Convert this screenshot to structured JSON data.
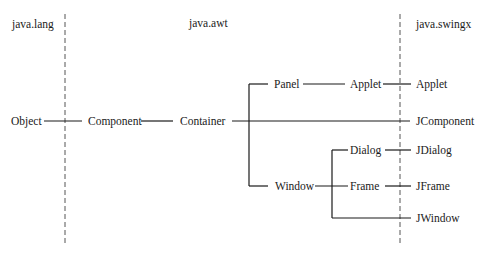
{
  "packages": [
    {
      "id": "lang",
      "label": "java.lang"
    },
    {
      "id": "awt",
      "label": "java.awt"
    },
    {
      "id": "swingx",
      "label": "java.swingx"
    }
  ],
  "nodes": {
    "object": "Object",
    "component": "Component",
    "container": "Container",
    "panel": "Panel",
    "applet_awt": "Applet",
    "applet_swing": "Applet",
    "jcomponent": "JComponent",
    "window": "Window",
    "dialog": "Dialog",
    "frame": "Frame",
    "jdialog": "JDialog",
    "jframe": "JFrame",
    "jwindow": "JWindow"
  },
  "colors": {
    "line": "#1a1a1a",
    "dashed": "#555555",
    "background": "#ffffff"
  }
}
